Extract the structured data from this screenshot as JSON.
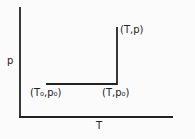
{
  "diagram": {
    "axes": {
      "x_label": "T",
      "y_label": "p"
    },
    "points": {
      "start": "(T₀,p₀)",
      "corner": "(T,p₀)",
      "end": "(T,p)"
    },
    "colors": {
      "line": "#222222",
      "background": "#fbfbfb"
    }
  }
}
